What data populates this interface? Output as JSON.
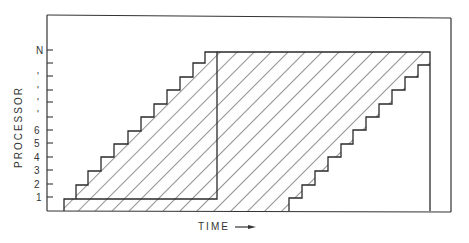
{
  "diagram": {
    "type": "processor-time schedule diagram",
    "y_axis": {
      "title": "PROCESSOR",
      "tick_labels": [
        "N",
        "",
        "",
        "",
        "",
        "",
        "6",
        "5",
        "4",
        "3",
        "2",
        "1"
      ],
      "ellipsis_labels": [
        "'",
        "'",
        "'",
        "'"
      ]
    },
    "x_axis": {
      "title": "TIME",
      "arrow": "right-arrow"
    },
    "regions": [
      {
        "name": "left-staircase-block",
        "fill": "diagonal-hatch",
        "steps": 12
      },
      {
        "name": "right-parallelogram-block",
        "fill": "diagonal-hatch",
        "steps": 12
      }
    ],
    "colors": {
      "line": "#2a2a2a",
      "background": "#ffffff"
    }
  }
}
